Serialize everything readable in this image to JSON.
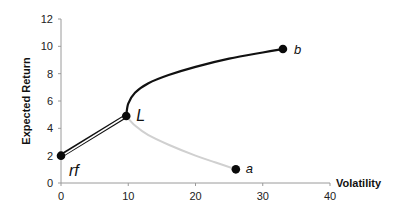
{
  "chart_data": {
    "type": "line",
    "title": "",
    "xlabel": "Volatility",
    "ylabel": "Expected Return",
    "xlim": [
      0,
      40
    ],
    "ylim": [
      0,
      12
    ],
    "x_ticks": [
      "0",
      "10",
      "20",
      "30",
      "40"
    ],
    "y_ticks": [
      "0",
      "2",
      "4",
      "6",
      "8",
      "10",
      "12"
    ],
    "grid": false,
    "legend": null,
    "points": [
      {
        "label": "rf",
        "x": 0,
        "y": 2.0
      },
      {
        "label": "L",
        "x": 9.7,
        "y": 4.9
      },
      {
        "label": "a",
        "x": 26,
        "y": 1.0
      },
      {
        "label": "b",
        "x": 33,
        "y": 9.8
      }
    ],
    "series": [
      {
        "name": "efficient frontier (upper, dark)",
        "color": "#111111",
        "x": [
          9.7,
          10.0,
          11.0,
          13.0,
          16.0,
          20.0,
          25.0,
          30.0,
          33.0
        ],
        "y": [
          4.9,
          5.8,
          6.6,
          7.3,
          7.9,
          8.5,
          9.1,
          9.55,
          9.8
        ]
      },
      {
        "name": "inefficient frontier (lower, light)",
        "color": "#d0d0d0",
        "x": [
          9.7,
          11.0,
          13.0,
          16.0,
          20.0,
          23.0,
          26.0
        ],
        "y": [
          4.9,
          4.2,
          3.5,
          2.8,
          2.0,
          1.5,
          1.0
        ]
      },
      {
        "name": "capital line rf-L (double line)",
        "color": "#111111",
        "x": [
          0,
          9.7
        ],
        "y": [
          2.0,
          4.9
        ]
      }
    ],
    "annotations": [
      "rf",
      "L",
      "a",
      "b"
    ]
  }
}
